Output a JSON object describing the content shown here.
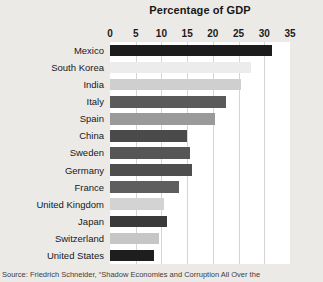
{
  "chart_data": {
    "type": "bar",
    "orientation": "horizontal",
    "title": "Percentage of GDP",
    "xlabel": "",
    "ylabel": "",
    "xlim": [
      0,
      35
    ],
    "xticks": [
      0,
      5,
      10,
      15,
      20,
      25,
      30,
      35
    ],
    "xtick_labels": [
      "0",
      "5",
      "10",
      "15",
      "20",
      "25",
      "30",
      "35"
    ],
    "grid": true,
    "grid_axis": "x",
    "legend": false,
    "categories": [
      "Mexico",
      "South Korea",
      "India",
      "Italy",
      "Spain",
      "China",
      "Sweden",
      "Germany",
      "France",
      "United Kingdom",
      "Japan",
      "Switzerland",
      "United States"
    ],
    "values": [
      31.5,
      27.5,
      25.5,
      22.5,
      20.5,
      15,
      15.5,
      16,
      13.5,
      10.5,
      11,
      9.5,
      8.5
    ],
    "bar_colors": [
      "#1c1c1c",
      "#ececec",
      "#cfcfcf",
      "#5a5a5a",
      "#9a9a9a",
      "#4a4a4a",
      "#565656",
      "#4e4e4e",
      "#5e5e5e",
      "#d3d3d3",
      "#3a3a3a",
      "#c6c6c6",
      "#1e1e1e"
    ]
  },
  "source": {
    "note": "Source: Friedrich Schneider, “Shadow Economies and Corruption All Over the"
  },
  "style": {
    "page_background": "#eceae7",
    "plot_background": "#ffffff",
    "gridline_color": "#d7d5d2",
    "text_color": "#17171a"
  }
}
